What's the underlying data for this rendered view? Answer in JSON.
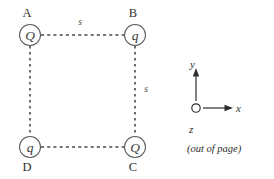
{
  "figure": {
    "background_color": "#ffffff",
    "stroke_color": "#4a4a4a",
    "text_color": "#2e2e2e"
  },
  "charges": [
    {
      "corner_label": "A",
      "charge_symbol": "Q",
      "position": "top-left",
      "cx": 30,
      "cy": 35,
      "label_x": 27,
      "label_y": 17
    },
    {
      "corner_label": "B",
      "charge_symbol": "q",
      "position": "top-right",
      "cx": 135,
      "cy": 35,
      "label_x": 133,
      "label_y": 17
    },
    {
      "corner_label": "C",
      "charge_symbol": "Q",
      "position": "bottom-right",
      "cx": 135,
      "cy": 147,
      "label_x": 133,
      "label_y": 171
    },
    {
      "corner_label": "D",
      "charge_symbol": "q",
      "position": "bottom-left",
      "cx": 30,
      "cy": 147,
      "label_x": 27,
      "label_y": 171
    }
  ],
  "side_labels": [
    {
      "text": "s",
      "edge": "top",
      "x": 80,
      "y": 25
    },
    {
      "text": "s",
      "edge": "right",
      "x": 146,
      "y": 92
    }
  ],
  "axes": {
    "y_label": "y",
    "x_label": "x",
    "z_label": "z",
    "z_note": "(out of page)",
    "origin_x": 196,
    "origin_y": 108
  }
}
